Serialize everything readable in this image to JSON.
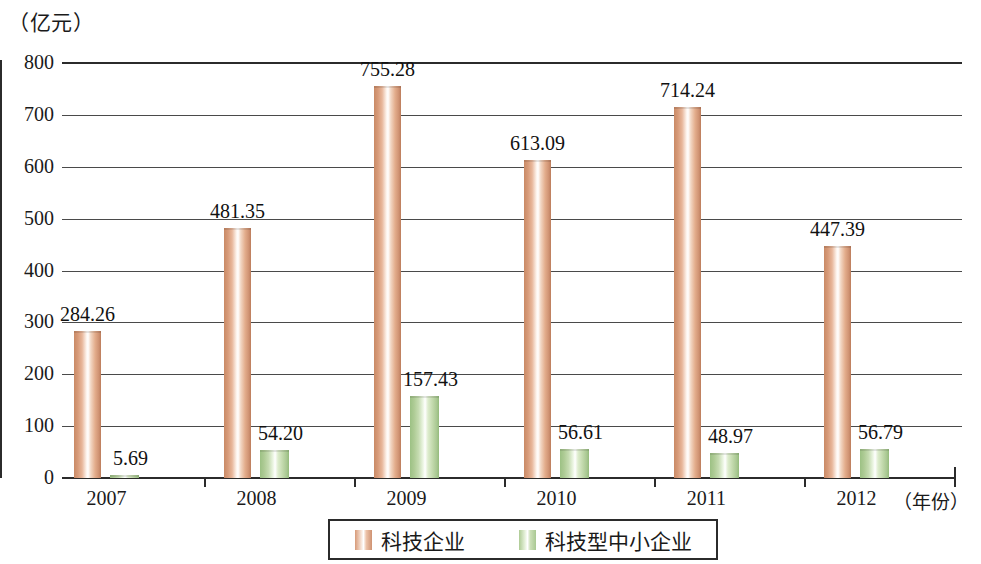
{
  "chart_data": {
    "type": "bar",
    "title": "",
    "subtitle": "",
    "unit_label": "（亿元）",
    "xlabel": "（年份）",
    "ylabel": "",
    "categories": [
      "2007",
      "2008",
      "2009",
      "2010",
      "2011",
      "2012"
    ],
    "series": [
      {
        "name": "科技企业",
        "color": "#d79a78",
        "values": [
          284.26,
          481.35,
          755.28,
          613.09,
          714.24,
          447.39
        ],
        "labels": [
          "284.26",
          "481.35",
          "755.28",
          "613.09",
          "714.24",
          "447.39"
        ]
      },
      {
        "name": "科技型中小企业",
        "color": "#aecb95",
        "values": [
          5.69,
          54.2,
          157.43,
          56.61,
          48.97,
          56.79
        ],
        "labels": [
          "5.69",
          "54.20",
          "157.43",
          "56.61",
          "48.97",
          "56.79"
        ]
      }
    ],
    "ylim": [
      0,
      800
    ],
    "yticks": [
      0,
      100,
      200,
      300,
      400,
      500,
      600,
      700,
      800
    ],
    "ytick_labels": [
      "0",
      "100",
      "200",
      "300",
      "400",
      "500",
      "600",
      "700",
      "800"
    ],
    "grid": true,
    "legend_position": "bottom"
  },
  "axis": {
    "unit_caption": "（亿元）",
    "x_caption": "（年份）"
  },
  "legend": {
    "items": [
      {
        "label": "科技企业"
      },
      {
        "label": "科技型中小企业"
      }
    ]
  }
}
